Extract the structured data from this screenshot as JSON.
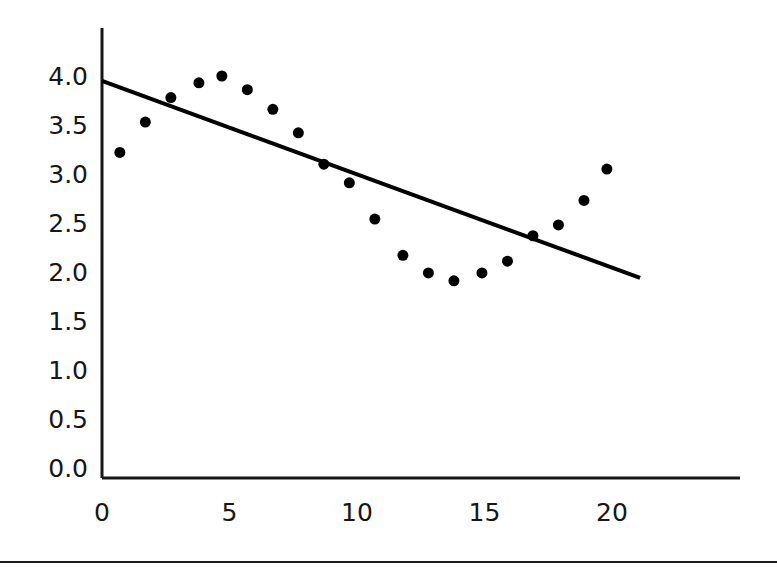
{
  "chart_data": {
    "type": "scatter",
    "title": "",
    "subtitle": "",
    "xlabel": "",
    "ylabel": "",
    "xlim": [
      -0.8,
      24.2
    ],
    "ylim": [
      0.0,
      4.35
    ],
    "grid": false,
    "legend": null,
    "x_ticks": [
      "0",
      "5",
      "10",
      "15",
      "20"
    ],
    "x_tick_values": [
      0,
      5,
      10,
      15,
      20
    ],
    "y_ticks": [
      "0.0",
      "0.5",
      "1.0",
      "1.5",
      "2.0",
      "2.5",
      "3.0",
      "3.5",
      "4.0"
    ],
    "y_tick_values": [
      0.0,
      0.5,
      1.0,
      1.5,
      2.0,
      2.5,
      3.0,
      3.5,
      4.0
    ],
    "series": [
      {
        "name": "data-points",
        "type": "scatter",
        "marker": "filled-circle",
        "marker_size": 11,
        "color": "#000000",
        "x": [
          0.7,
          1.7,
          2.7,
          3.8,
          4.7,
          5.7,
          6.7,
          7.7,
          8.7,
          9.7,
          10.7,
          11.8,
          12.8,
          13.8,
          14.9,
          15.9,
          16.9,
          17.9,
          18.9,
          19.8
        ],
        "y": [
          3.22,
          3.53,
          3.78,
          3.93,
          4.0,
          3.86,
          3.66,
          3.42,
          3.1,
          2.91,
          2.54,
          2.17,
          1.99,
          1.91,
          1.99,
          2.11,
          2.37,
          2.48,
          2.73,
          3.05
        ]
      },
      {
        "name": "trend-line",
        "type": "line",
        "color": "#000000",
        "width": 4,
        "x": [
          0.0,
          21.1
        ],
        "y": [
          3.95,
          1.94
        ]
      }
    ]
  },
  "axes": {
    "y_axis_color": "#161616",
    "x_axis_color": "#161616",
    "axis_width": 3
  },
  "figure": {
    "background": "#ffffff",
    "rule_color": "#1a1a1a"
  }
}
